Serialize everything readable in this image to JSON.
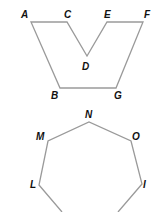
{
  "figures": [
    {
      "name": "concave-polygon",
      "stroke_color": "#9a9a9a",
      "vertices": [
        {
          "label": "A",
          "x": 31,
          "y": 22,
          "lx": 21,
          "ly": 18
        },
        {
          "label": "C",
          "x": 67,
          "y": 22,
          "lx": 64,
          "ly": 18
        },
        {
          "label": "D",
          "x": 87,
          "y": 56,
          "lx": 82,
          "ly": 70
        },
        {
          "label": "E",
          "x": 107,
          "y": 22,
          "lx": 104,
          "ly": 18
        },
        {
          "label": "F",
          "x": 143,
          "y": 22,
          "lx": 144,
          "ly": 18
        },
        {
          "label": "G",
          "x": 116,
          "y": 88,
          "lx": 114,
          "ly": 99
        },
        {
          "label": "B",
          "x": 60,
          "y": 88,
          "lx": 51,
          "ly": 99
        }
      ]
    },
    {
      "name": "partial-polygon",
      "stroke_color": "#9a9a9a",
      "vertices": [
        {
          "label": "",
          "x": 62,
          "y": 212
        },
        {
          "label": "L",
          "x": 39,
          "y": 185,
          "lx": 30,
          "ly": 188
        },
        {
          "label": "M",
          "x": 48,
          "y": 141,
          "lx": 36,
          "ly": 140
        },
        {
          "label": "N",
          "x": 89,
          "y": 122,
          "lx": 85,
          "ly": 118
        },
        {
          "label": "O",
          "x": 131,
          "y": 141,
          "lx": 132,
          "ly": 140
        },
        {
          "label": "I",
          "x": 142,
          "y": 184,
          "lx": 143,
          "ly": 188
        },
        {
          "label": "",
          "x": 118,
          "y": 212
        }
      ]
    }
  ]
}
